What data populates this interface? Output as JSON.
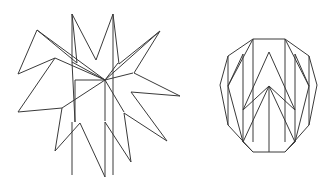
{
  "figure": {
    "title": "",
    "background_color": "#ffffff",
    "stroke_color": "#3a3a3a",
    "stroke_width": 1,
    "canvas": {
      "width": 335,
      "height": 182
    },
    "shapes": [
      {
        "name": "eleven-pointed-star",
        "kind": "star-polygon",
        "points": 11,
        "center": [
          96,
          94
        ],
        "outer_radius": 82,
        "inner_radius": 34,
        "outline": "18,74 55,58 18,112 62,108 55,151 80,123 105,177 105,122 131,162 124,113 167,141 131,92 180,96 134,73 160,31 119,64 113,14 96,60 72,14 77,63 37,30",
        "interior_lines": [
          "105,80 72,60",
          "105,80 55,58",
          "105,80 37,30",
          "105,80 62,108",
          "105,80 75,80",
          "105,80 105,122",
          "105,80 124,113",
          "105,80 160,31",
          "105,80 134,73",
          "105,80 113,63"
        ]
      },
      {
        "name": "decagon-with-zigzag",
        "kind": "decagon",
        "sides": 10,
        "center": [
          269,
          95
        ],
        "radius": 57,
        "outline": "253,39 285,39 309,56 317,85 309,125 285,152 253,152 228,125 220,85 228,56",
        "interior_lines": [
          "228,56 228,125",
          "309,56 309,125",
          "228,85 253,39",
          "309,85 285,39",
          "228,85 243,142",
          "309,85 295,142",
          "243,142 269,85",
          "295,142 269,85",
          "269,85 269,152",
          "253,39 253,142",
          "285,39 285,142",
          "269,52 295,110",
          "243,110 269,52"
        ]
      }
    ]
  }
}
